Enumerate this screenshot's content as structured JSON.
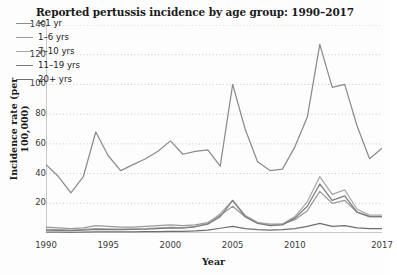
{
  "chart_data": {
    "type": "line",
    "title": "Reported pertussis incidence by age group: 1990–2017",
    "xlabel": "Year",
    "ylabel": "Incidence rate (per 100,000)",
    "xlim": [
      1990,
      2017
    ],
    "ylim": [
      0,
      140
    ],
    "yticks": [
      20,
      40,
      60,
      80,
      100,
      120,
      140
    ],
    "xticks": [
      1990,
      1995,
      2000,
      2005,
      2010,
      2017
    ],
    "grid": "horizontal-dotted",
    "legend_position": "upper-left-inside",
    "x": [
      1990,
      1991,
      1992,
      1993,
      1994,
      1995,
      1996,
      1997,
      1998,
      1999,
      2000,
      2001,
      2002,
      2003,
      2004,
      2005,
      2006,
      2007,
      2008,
      2009,
      2010,
      2011,
      2012,
      2013,
      2014,
      2015,
      2016,
      2017
    ],
    "series": [
      {
        "name": "<1 yr",
        "color": "#8c8c8c",
        "values": [
          46,
          38,
          27,
          38,
          68,
          52,
          42,
          46,
          50,
          55,
          62,
          53,
          55,
          56,
          45,
          100,
          70,
          48,
          42,
          43,
          58,
          78,
          127,
          98,
          100,
          72,
          50,
          57
        ]
      },
      {
        "name": "1–6 yrs",
        "color": "#9a9a9a",
        "values": [
          4,
          3.5,
          3,
          3.5,
          5,
          4.5,
          4,
          4,
          4.5,
          5,
          5.5,
          5,
          5.5,
          7,
          12,
          18,
          11,
          7,
          6,
          6,
          9,
          15,
          28,
          20,
          22,
          14,
          11,
          11
        ]
      },
      {
        "name": "7–10 yrs",
        "color": "#a8a8a8",
        "values": [
          2.5,
          2.2,
          2,
          2.4,
          3,
          2.8,
          2.6,
          2.8,
          3,
          3.4,
          3.8,
          3.6,
          4.5,
          6.5,
          13,
          22,
          12,
          7,
          5.5,
          6,
          11,
          21,
          38,
          26,
          29,
          16,
          12,
          12
        ]
      },
      {
        "name": "11–19 yrs",
        "color": "#7d7d7d",
        "values": [
          2,
          1.8,
          1.6,
          2,
          2.5,
          2.3,
          2.2,
          2.4,
          2.6,
          3,
          3.4,
          3.2,
          4.2,
          6,
          11,
          22,
          11,
          6.5,
          5,
          5.5,
          10,
          18,
          33,
          22,
          25,
          14,
          11,
          11
        ]
      },
      {
        "name": "20+ yrs",
        "color": "#6e6e6e",
        "values": [
          0.6,
          0.6,
          0.5,
          0.6,
          0.8,
          0.7,
          0.7,
          0.8,
          0.9,
          1,
          1.1,
          1.1,
          1.4,
          2,
          3.2,
          4.5,
          3,
          2.2,
          2,
          2.2,
          3,
          4.5,
          6.5,
          4.5,
          5,
          3.5,
          3,
          3
        ]
      }
    ]
  }
}
